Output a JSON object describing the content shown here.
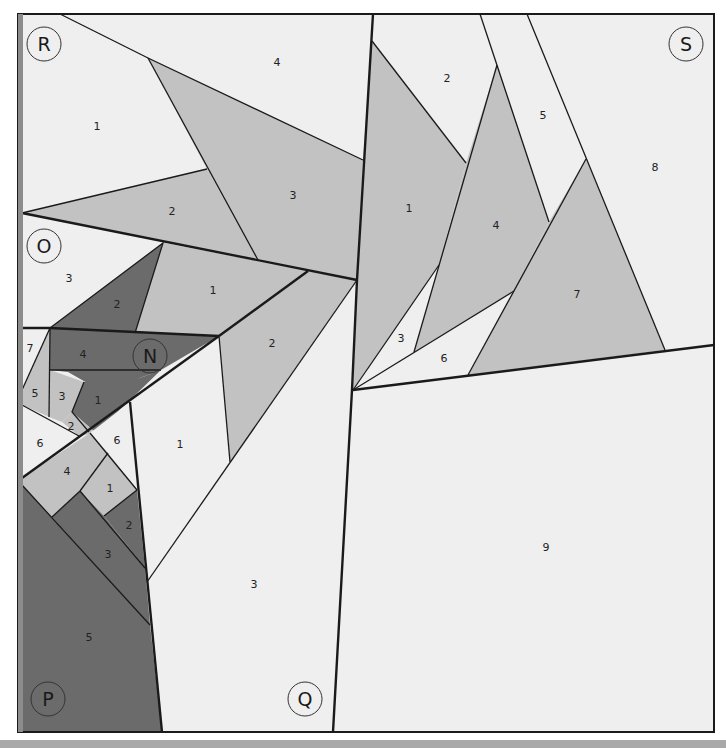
{
  "pattern": {
    "colors": {
      "light": "#efefef",
      "medium": "#c2c2c2",
      "dark": "#6b6b6b",
      "line": "#1a1a1a",
      "left_edge": "#8c8c8c",
      "bottom_bar": "#a9a9a9"
    },
    "sections": [
      {
        "letter": "R",
        "pieces": [
          "1",
          "2",
          "3",
          "4"
        ]
      },
      {
        "letter": "S",
        "pieces": [
          "1",
          "2",
          "3",
          "4",
          "5",
          "6",
          "7",
          "8",
          "9"
        ]
      },
      {
        "letter": "O",
        "pieces": [
          "1",
          "2",
          "3"
        ]
      },
      {
        "letter": "N",
        "pieces": [
          "1",
          "2",
          "3",
          "4",
          "5",
          "6",
          "7"
        ]
      },
      {
        "letter": "Q",
        "pieces": [
          "1",
          "2",
          "3"
        ]
      },
      {
        "letter": "P",
        "pieces": [
          "1",
          "2",
          "3",
          "4",
          "5",
          "6"
        ]
      }
    ],
    "labels": {
      "R": "R",
      "S": "S",
      "O": "O",
      "N": "N",
      "P": "P",
      "Q": "Q",
      "R1": "1",
      "R2": "2",
      "R3": "3",
      "R4": "4",
      "S1": "1",
      "S2": "2",
      "S3": "3",
      "S4": "4",
      "S5": "5",
      "S6": "6",
      "S7": "7",
      "S8": "8",
      "S9": "9",
      "O1": "1",
      "O2": "2",
      "O3": "3",
      "N1": "1",
      "N2": "2",
      "N3": "3",
      "N4": "4",
      "N5": "5",
      "N6": "6",
      "N7": "7",
      "Q1": "1",
      "Q2": "2",
      "Q3": "3",
      "P1": "1",
      "P2": "2",
      "P3": "3",
      "P4": "4",
      "P5": "5",
      "P6": "6"
    }
  }
}
